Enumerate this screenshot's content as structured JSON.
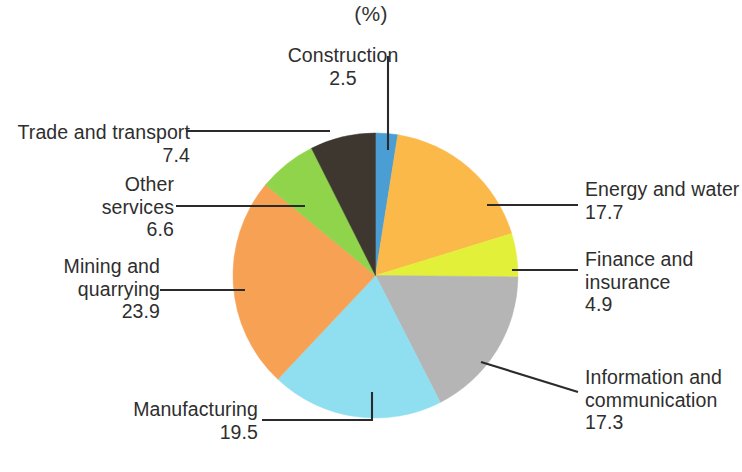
{
  "chart_data": {
    "type": "pie",
    "title": "(%)",
    "xlabel": "",
    "ylabel": "",
    "unit": "%",
    "legend_position": "callout-labels",
    "grid": false,
    "start_angle_deg": 0,
    "direction": "clockwise",
    "categories": [
      "Construction",
      "Energy and water",
      "Finance and insurance",
      "Information and communication",
      "Manufacturing",
      "Mining and quarrying",
      "Other services",
      "Trade and transport"
    ],
    "values": [
      2.5,
      17.7,
      4.9,
      17.3,
      19.5,
      23.9,
      6.6,
      7.4
    ],
    "colors": [
      "#4a9ed4",
      "#fbb949",
      "#e2f03a",
      "#b5b5b5",
      "#8fdff0",
      "#f7a154",
      "#8fd44a",
      "#3d3730"
    ],
    "slices": [
      {
        "label": "Construction",
        "value": "2.5",
        "value_num": 2.5,
        "color": "#4a9ed4"
      },
      {
        "label": "Energy and water",
        "value": "17.7",
        "value_num": 17.7,
        "color": "#fbb949"
      },
      {
        "label": "Finance and insurance",
        "value": "4.9",
        "value_num": 4.9,
        "color": "#e2f03a"
      },
      {
        "label": "Information and communication",
        "value": "17.3",
        "value_num": 17.3,
        "color": "#b5b5b5"
      },
      {
        "label": "Manufacturing",
        "value": "19.5",
        "value_num": 19.5,
        "color": "#8fdff0"
      },
      {
        "label": "Mining and quarrying",
        "value": "23.9",
        "value_num": 23.9,
        "color": "#f7a154"
      },
      {
        "label": "Other services",
        "value": "6.6",
        "value_num": 6.6,
        "color": "#8fd44a"
      },
      {
        "label": "Trade and transport",
        "value": "7.4",
        "value_num": 7.4,
        "color": "#3d3730"
      }
    ]
  },
  "labels": {
    "construction": {
      "line1": "Construction",
      "value": "2.5"
    },
    "trade": {
      "line1": "Trade and transport",
      "value": "7.4"
    },
    "other_services": {
      "line1": "Other",
      "line2": "services",
      "value": "6.6"
    },
    "mining": {
      "line1": "Mining and",
      "line2": "quarrying",
      "value": "23.9"
    },
    "manufacturing": {
      "line1": "Manufacturing",
      "value": "19.5"
    },
    "energy": {
      "line1": "Energy and water",
      "value": "17.7"
    },
    "finance": {
      "line1": "Finance and",
      "line2": "insurance",
      "value": "4.9"
    },
    "infocom": {
      "line1": "Information and",
      "line2": "communication",
      "value": "17.3"
    }
  }
}
